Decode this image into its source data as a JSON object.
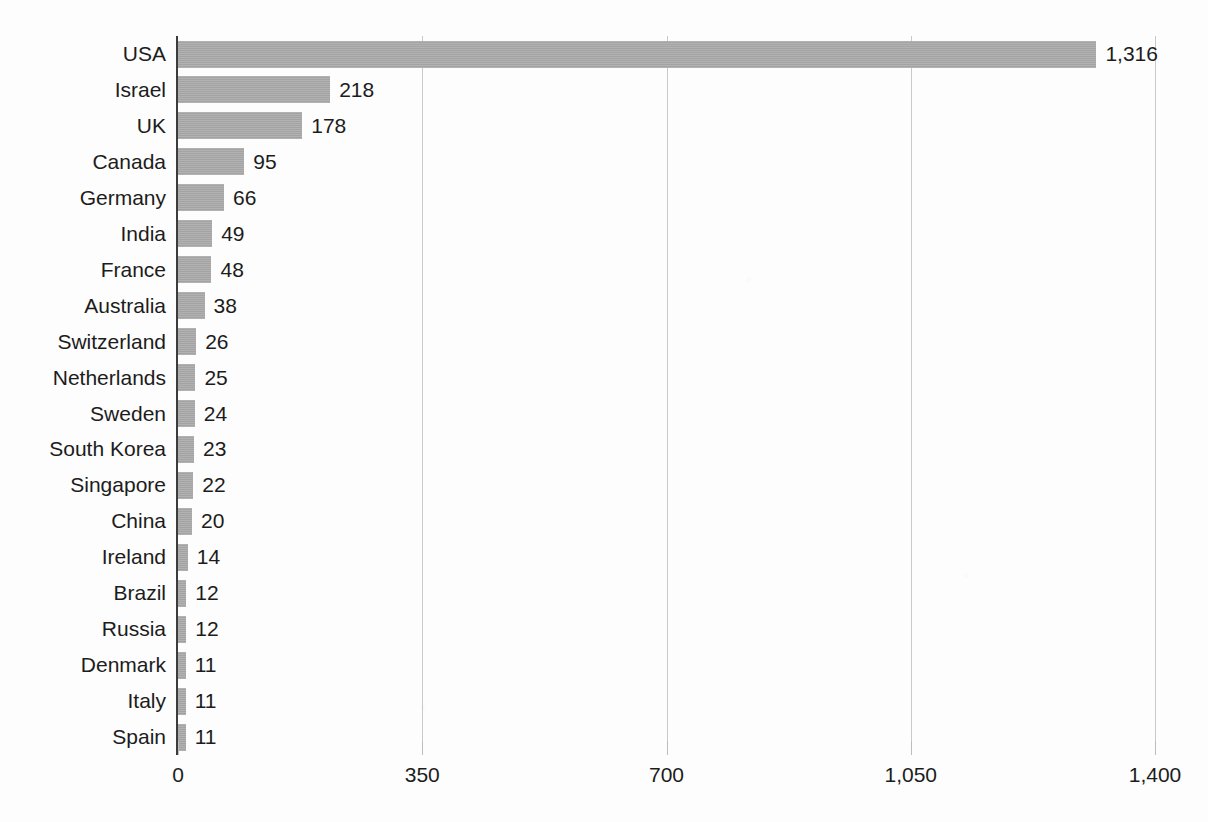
{
  "chart_data": {
    "type": "bar",
    "orientation": "horizontal",
    "title": "",
    "xlabel": "",
    "ylabel": "",
    "xlim": [
      0,
      1400
    ],
    "grid": true,
    "legend": "none",
    "xticks": [
      "0",
      "350",
      "700",
      "1,050",
      "1,400"
    ],
    "xtick_values": [
      0,
      350,
      700,
      1050,
      1400
    ],
    "bar_color": "#a9a9a9",
    "axis_color": "#3c3c3c",
    "gridline_color": "#c9c9c9",
    "text_color": "#1c1c1c",
    "categories": [
      "USA",
      "Israel",
      "UK",
      "Canada",
      "Germany",
      "India",
      "France",
      "Australia",
      "Switzerland",
      "Netherlands",
      "Sweden",
      "South Korea",
      "Singapore",
      "China",
      "Ireland",
      "Brazil",
      "Russia",
      "Denmark",
      "Italy",
      "Spain"
    ],
    "values": [
      1316,
      218,
      178,
      95,
      66,
      49,
      48,
      38,
      26,
      25,
      24,
      23,
      22,
      20,
      14,
      12,
      12,
      11,
      11,
      11
    ],
    "value_labels": [
      "1,316",
      "218",
      "178",
      "95",
      "66",
      "49",
      "48",
      "38",
      "26",
      "25",
      "24",
      "23",
      "22",
      "20",
      "14",
      "12",
      "12",
      "11",
      "11",
      "11"
    ]
  }
}
